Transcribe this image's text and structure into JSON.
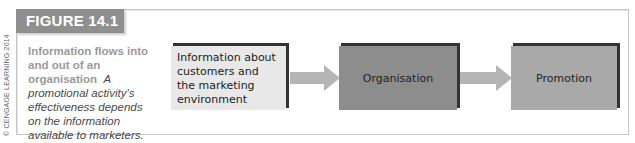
{
  "figure": {
    "label": "FIGURE 14.1",
    "credit": "© CENGAGE LEARNING 2014",
    "caption_title": "Information flows into and out of an organisation",
    "caption_text": "A promotional activity's effectiveness depends on the information available to marketers."
  },
  "diagram": {
    "nodes": [
      {
        "id": "info",
        "label": "Information about customers and the marketing environment",
        "fill": "#e8e8e8"
      },
      {
        "id": "org",
        "label": "Organisation",
        "fill": "#8d8d8d"
      },
      {
        "id": "promo",
        "label": "Promotion",
        "fill": "#a9a9a9"
      }
    ],
    "edges": [
      {
        "from": "info",
        "to": "org"
      },
      {
        "from": "org",
        "to": "promo"
      }
    ],
    "arrow_color": "#b5b5b5"
  }
}
